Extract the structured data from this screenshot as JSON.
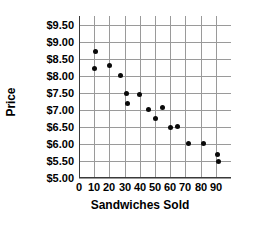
{
  "chart_data": {
    "type": "scatter",
    "title": "",
    "xlabel": "Sandwiches Sold",
    "ylabel": "Price",
    "xlim": [
      0,
      100
    ],
    "ylim": [
      5.0,
      9.75
    ],
    "grid": true,
    "legend": false,
    "xticks": [
      0,
      10,
      20,
      30,
      40,
      50,
      60,
      70,
      80,
      90
    ],
    "xtick_labels": [
      "0",
      "10",
      "20",
      "30",
      "40",
      "50",
      "60",
      "70",
      "80",
      "90"
    ],
    "yticks": [
      5.0,
      5.5,
      6.0,
      6.5,
      7.0,
      7.5,
      8.0,
      8.5,
      9.0,
      9.5
    ],
    "ytick_labels": [
      "$5.00",
      "$5.50",
      "$6.00",
      "$6.50",
      "$7.00",
      "$7.50",
      "$8.00",
      "$8.50",
      "$9.00",
      "$9.50"
    ],
    "series": [
      {
        "name": "Sandwich price vs quantity sold",
        "marker": "circle",
        "color": "#0a0a0a",
        "points": [
          {
            "x": 11,
            "y": 8.7
          },
          {
            "x": 10,
            "y": 8.22
          },
          {
            "x": 20,
            "y": 8.3
          },
          {
            "x": 27,
            "y": 8.0
          },
          {
            "x": 31,
            "y": 7.48
          },
          {
            "x": 32,
            "y": 7.18
          },
          {
            "x": 40,
            "y": 7.45
          },
          {
            "x": 46,
            "y": 7.0
          },
          {
            "x": 50,
            "y": 6.75
          },
          {
            "x": 55,
            "y": 7.08
          },
          {
            "x": 60,
            "y": 6.48
          },
          {
            "x": 65,
            "y": 6.5
          },
          {
            "x": 72,
            "y": 6.0
          },
          {
            "x": 82,
            "y": 6.0
          },
          {
            "x": 91,
            "y": 5.68
          },
          {
            "x": 92,
            "y": 5.47
          }
        ]
      }
    ]
  },
  "axis_titles": {
    "x": "Sandwiches Sold",
    "y": "Price"
  }
}
